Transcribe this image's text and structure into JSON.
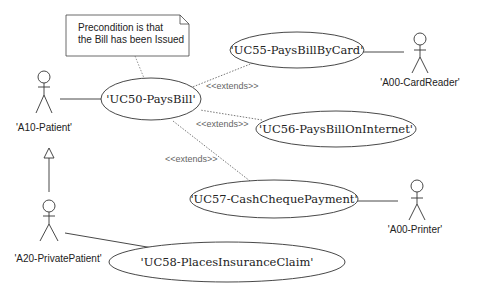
{
  "diagram": {
    "type": "uml-use-case",
    "note": {
      "lines": [
        "Precondition is that",
        "the Bill has been Issued"
      ]
    },
    "actors": [
      {
        "id": "A10",
        "label": "'A10-Patient'"
      },
      {
        "id": "A20",
        "label": "'A20-PrivatePatient'"
      },
      {
        "id": "A00CR",
        "label": "'A00-CardReader'"
      },
      {
        "id": "A00P",
        "label": "'A00-Printer'"
      }
    ],
    "use_cases": [
      {
        "id": "UC50",
        "label": "'UC50-PaysBill'"
      },
      {
        "id": "UC55",
        "label": "'UC55-PaysBillByCard'"
      },
      {
        "id": "UC56",
        "label": "'UC56-PaysBillOnInternet'"
      },
      {
        "id": "UC57",
        "label": "'UC57-CashChequePayment'"
      },
      {
        "id": "UC58",
        "label": "'UC58-PlacesInsuranceClaim'"
      }
    ],
    "relationships": [
      {
        "from": "A10",
        "to": "UC50",
        "type": "association"
      },
      {
        "from": "A20",
        "to": "A10",
        "type": "generalization"
      },
      {
        "from": "A20",
        "to": "UC58",
        "type": "association"
      },
      {
        "from": "UC55",
        "to": "A00CR",
        "type": "association"
      },
      {
        "from": "UC57",
        "to": "A00P",
        "type": "association"
      },
      {
        "from": "UC55",
        "to": "UC50",
        "type": "extends",
        "label": "<<extends>>"
      },
      {
        "from": "UC56",
        "to": "UC50",
        "type": "extends",
        "label": "<<extends>>"
      },
      {
        "from": "UC57",
        "to": "UC50",
        "type": "extends",
        "label": "<<extends>>"
      },
      {
        "from": "note",
        "to": "UC50",
        "type": "anchor"
      }
    ],
    "extends_labels": [
      "<<extends>>",
      "<<extends>>",
      "<<extends>>"
    ]
  }
}
